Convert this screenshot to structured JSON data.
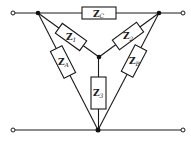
{
  "diagram": {
    "type": "circuit",
    "impedances": [
      {
        "id": "zc",
        "main": "Z",
        "sub": "C"
      },
      {
        "id": "z1",
        "main": "Z",
        "sub": "1"
      },
      {
        "id": "z2",
        "main": "Z",
        "sub": "2"
      },
      {
        "id": "z3",
        "main": "Z",
        "sub": "3"
      },
      {
        "id": "za",
        "main": "Z",
        "sub": "A"
      },
      {
        "id": "zb",
        "main": "Z",
        "sub": "B"
      }
    ],
    "colors": {
      "line": "#1a1a1a",
      "background": "#ffffff"
    }
  }
}
